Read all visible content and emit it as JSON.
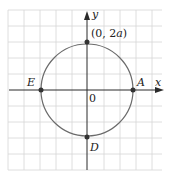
{
  "figure": {
    "type": "circle-on-grid",
    "axes": {
      "x_label": "x",
      "y_label": "y",
      "origin_label": "0"
    },
    "circle": {
      "center": "origin",
      "stroke_color": "#6b6b6b"
    },
    "points": [
      {
        "name": "top",
        "label": "(0, 2a)",
        "label_plain": "(0, 2",
        "label_italic": "a",
        "label_close": ")"
      },
      {
        "name": "A",
        "label": "A"
      },
      {
        "name": "E",
        "label": "E"
      },
      {
        "name": "D",
        "label": "D"
      }
    ],
    "colors": {
      "grid": "#d9d9d9",
      "axis": "#2a2a2a",
      "circle": "#6b6b6b",
      "point": "#333333"
    }
  }
}
